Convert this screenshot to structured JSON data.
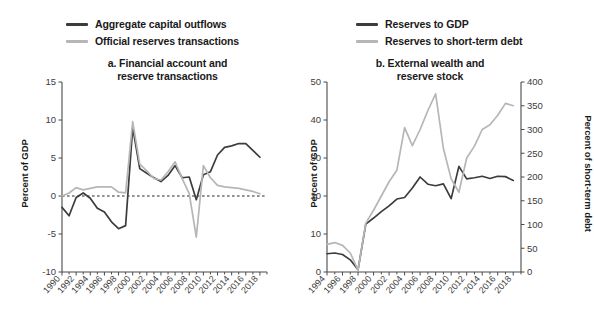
{
  "colors": {
    "dark_series": "#3c3c3c",
    "light_series": "#b6b6b6",
    "axis": "#4a4a4a",
    "text": "#1a1a1a",
    "background": "#ffffff"
  },
  "panel_a": {
    "title": "a. Financial account and\nreserve transactions",
    "legend": [
      {
        "label": "Aggregate capital outflows",
        "color": "#3c3c3c"
      },
      {
        "label": "Official reserves transactions",
        "color": "#b6b6b6"
      }
    ],
    "y_axis_title": "Percent of GDP"
  },
  "panel_b": {
    "title": "b. External wealth and\nreserve stock",
    "legend": [
      {
        "label": "Reserves to GDP",
        "color": "#3c3c3c"
      },
      {
        "label": "Reserves to short-term debt",
        "color": "#b6b6b6"
      }
    ],
    "y_axis_title": "Percent of GDP",
    "y2_axis_title": "Percent of short-term debt"
  },
  "chart_data": [
    {
      "id": "panel-a",
      "type": "line",
      "title": "a. Financial account and reserve transactions",
      "xlabel": "",
      "ylabel": "Percent of GDP",
      "ylim": [
        -10,
        15
      ],
      "yticks": [
        -10,
        -5,
        0,
        5,
        10,
        15
      ],
      "xlim": [
        1990,
        2019
      ],
      "xticks": [
        1990,
        1992,
        1994,
        1996,
        1998,
        2000,
        2002,
        2004,
        2006,
        2008,
        2010,
        2012,
        2014,
        2016,
        2018
      ],
      "grid": false,
      "zero_line": true,
      "legend_position": "above",
      "x": [
        1990,
        1991,
        1992,
        1993,
        1994,
        1995,
        1996,
        1997,
        1998,
        1999,
        2000,
        2001,
        2002,
        2003,
        2004,
        2005,
        2006,
        2007,
        2008,
        2009,
        2010,
        2011,
        2012,
        2013,
        2014,
        2015,
        2016,
        2017,
        2018
      ],
      "series": [
        {
          "name": "Aggregate capital outflows",
          "color": "#3c3c3c",
          "values": [
            -1.5,
            -2.6,
            -0.2,
            0.4,
            -0.3,
            -1.6,
            -2.1,
            -3.4,
            -4.3,
            -3.9,
            9.0,
            3.6,
            3.0,
            2.4,
            1.9,
            2.7,
            4.0,
            2.4,
            2.5,
            -0.5,
            2.8,
            3.2,
            5.4,
            6.4,
            6.6,
            6.9,
            6.9,
            6.0,
            5.1,
            3.8
          ]
        },
        {
          "name": "Official reserves transactions",
          "color": "#b6b6b6",
          "values": [
            0.0,
            0.4,
            1.1,
            0.8,
            1.0,
            1.2,
            1.2,
            1.2,
            0.5,
            0.4,
            9.8,
            4.2,
            3.3,
            2.3,
            2.1,
            3.2,
            4.5,
            2.3,
            0.3,
            -5.4,
            4.0,
            2.4,
            1.4,
            1.2,
            1.1,
            1.0,
            0.8,
            0.6,
            0.3,
            0.9
          ]
        }
      ]
    },
    {
      "id": "panel-b",
      "type": "line",
      "title": "b. External wealth and reserve stock",
      "xlabel": "",
      "ylabel": "Percent of GDP",
      "y2label": "Percent of short-term debt",
      "ylim": [
        0,
        50
      ],
      "yticks": [
        0,
        10,
        20,
        30,
        40,
        50
      ],
      "y2lim": [
        0,
        400
      ],
      "y2ticks": [
        0,
        50,
        100,
        150,
        200,
        250,
        300,
        350,
        400
      ],
      "xlim": [
        1994,
        2019
      ],
      "xticks": [
        1994,
        1996,
        1998,
        2000,
        2002,
        2004,
        2006,
        2008,
        2010,
        2012,
        2014,
        2016,
        2018
      ],
      "grid": false,
      "legend_position": "above",
      "x": [
        1994,
        1995,
        1996,
        1997,
        1998,
        1999,
        2000,
        2001,
        2002,
        2003,
        2004,
        2005,
        2006,
        2007,
        2008,
        2009,
        2010,
        2011,
        2012,
        2013,
        2014,
        2015,
        2016,
        2017,
        2018
      ],
      "series": [
        {
          "name": "Reserves to GDP",
          "color": "#3c3c3c",
          "axis": "left",
          "values": [
            4.8,
            5.0,
            4.6,
            3.2,
            0.6,
            12.6,
            14.2,
            15.9,
            17.4,
            19.2,
            19.6,
            22.1,
            25.0,
            23.1,
            22.7,
            23.2,
            19.3,
            27.8,
            24.5,
            24.8,
            25.2,
            24.6,
            25.2,
            25.1,
            24.1,
            23.0
          ]
        },
        {
          "name": "Reserves to short-term debt",
          "color": "#b6b6b6",
          "axis": "right",
          "values": [
            58,
            62,
            56,
            40,
            4,
            103,
            130,
            160,
            190,
            214,
            304,
            266,
            300,
            340,
            375,
            260,
            196,
            168,
            240,
            265,
            300,
            310,
            330,
            355,
            350,
            310
          ]
        }
      ]
    }
  ]
}
